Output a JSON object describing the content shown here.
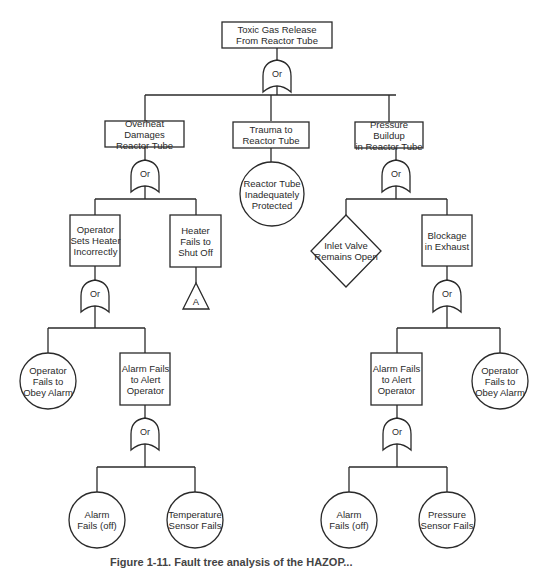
{
  "diagram": {
    "type": "fault-tree",
    "top_event": "Toxic Gas Release\nFrom Reactor Tube",
    "gate_label": "Or",
    "level1": {
      "overheat": "Overheat Damages\nReactor Tube",
      "trauma": "Trauma to\nReactor Tube",
      "pressure": "Pressure Buildup\nin Reactor Tube"
    },
    "trauma_basic": "Reactor Tube\nInadequately\nProtected",
    "overheat_children": {
      "operator_sets": "Operator\nSets Heater\nIncorrectly",
      "heater_fails": "Heater\nFails to\nShut Off",
      "transfer": "A"
    },
    "pressure_children": {
      "inlet_valve": "Inlet Valve\nRemains Open",
      "blockage": "Blockage\nin Exhaust"
    },
    "left_branch": {
      "operator_obey": "Operator\nFails to\nObey Alarm",
      "alarm_alert": "Alarm Fails\nto Alert\nOperator",
      "alarm_off": "Alarm\nFails (off)",
      "temp_sensor": "Temperature\nSensor Fails"
    },
    "right_branch": {
      "alarm_alert": "Alarm Fails\nto Alert\nOperator",
      "operator_obey": "Operator\nFails to\nObey Alarm",
      "alarm_off": "Alarm\nFails (off)",
      "pressure_sensor": "Pressure\nSensor Fails"
    },
    "caption": "Figure 1-11. Fault tree analysis of the HAZOP..."
  }
}
